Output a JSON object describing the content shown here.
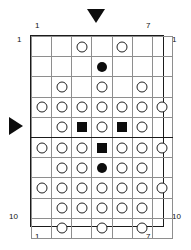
{
  "figure": {
    "type": "grid-diagram",
    "grid": {
      "columns": 7,
      "rows": 10,
      "thick_row_separator_after": 5,
      "thick_column_separator_before": 7
    },
    "labels": {
      "top_left_column": "1",
      "top_right_column": "7",
      "bottom_left_column": "1",
      "bottom_right_column": "7",
      "top_left_row": "1",
      "top_right_row": "1",
      "bottom_left_row": "10",
      "bottom_right_row": "10"
    },
    "markers": {
      "top_arrow": "triangle-down-marker",
      "left_arrow": "triangle-right-marker",
      "top_arrow_column": 4,
      "left_arrow_row": 6
    },
    "legend": {
      "open_circle": "open-circle",
      "filled_circle": "filled-circle",
      "filled_square": "filled-square",
      "empty": ""
    },
    "colors": {
      "ink": "#0d0d0d",
      "grid_line": "#8e8e8e",
      "border": "#1b1b1b",
      "background": "#ffffff"
    },
    "cells": [
      [
        "",
        "",
        "open-circle",
        "",
        "open-circle",
        "",
        ""
      ],
      [
        "",
        "",
        "",
        "filled-circle",
        "",
        "",
        ""
      ],
      [
        "",
        "open-circle",
        "",
        "open-circle",
        "",
        "open-circle",
        ""
      ],
      [
        "open-circle",
        "open-circle",
        "open-circle",
        "open-circle",
        "open-circle",
        "open-circle",
        "open-circle"
      ],
      [
        "",
        "open-circle",
        "filled-square",
        "open-circle",
        "filled-square",
        "open-circle",
        ""
      ],
      [
        "open-circle",
        "open-circle",
        "open-circle",
        "filled-square",
        "open-circle",
        "open-circle",
        "open-circle"
      ],
      [
        "",
        "open-circle",
        "open-circle",
        "filled-circle",
        "open-circle",
        "open-circle",
        ""
      ],
      [
        "open-circle",
        "open-circle",
        "open-circle",
        "open-circle",
        "open-circle",
        "open-circle",
        "open-circle"
      ],
      [
        "",
        "open-circle",
        "open-circle",
        "open-circle",
        "open-circle",
        "open-circle",
        ""
      ],
      [
        "",
        "open-circle",
        "",
        "open-circle",
        "",
        "open-circle",
        ""
      ]
    ]
  }
}
